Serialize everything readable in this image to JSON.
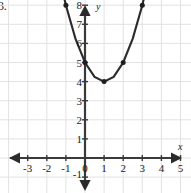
{
  "problem": {
    "number_label": "3."
  },
  "axes": {
    "x_name": "x",
    "y_name": "y",
    "x_tick_labels": [
      "-3",
      "-2",
      "-1",
      "0",
      "1",
      "2",
      "3",
      "4",
      "5"
    ],
    "x_tick_values": [
      -3,
      -2,
      -1,
      0,
      1,
      2,
      3,
      4,
      5
    ],
    "y_tick_labels": [
      "-1",
      "1",
      "2",
      "3",
      "4",
      "5",
      "6",
      "7",
      "8"
    ],
    "y_tick_values": [
      -1,
      1,
      2,
      3,
      4,
      5,
      6,
      7,
      8
    ],
    "origin_label": "0"
  },
  "colors": {
    "grid": "#e2e2e2",
    "axis": "#3a3a3a",
    "curve": "#2b2b2b",
    "point": "#1f1f1f",
    "text": "#1a1a1a",
    "background": "#ffffff"
  },
  "chart_data": {
    "type": "line",
    "title": "",
    "xlabel": "x",
    "ylabel": "y",
    "xlim": [
      -3.6,
      5.9
    ],
    "ylim": [
      -1.8,
      9.2
    ],
    "grid": true,
    "legend": "none",
    "series": [
      {
        "name": "parabola",
        "equation": "y = x^2 - 2x + 5",
        "vertex": [
          1,
          4
        ],
        "direction": "opens-up",
        "x": [
          -1.15,
          -1.0,
          -0.5,
          0.0,
          0.5,
          1.0,
          1.5,
          2.0,
          2.5,
          3.0,
          3.15
        ],
        "y": [
          8.64,
          8.0,
          6.25,
          5.0,
          4.25,
          4.0,
          4.25,
          5.0,
          6.25,
          8.0,
          8.64
        ],
        "marked_points": [
          {
            "x": -1,
            "y": 8
          },
          {
            "x": 0,
            "y": 5
          },
          {
            "x": 1,
            "y": 4
          },
          {
            "x": 2,
            "y": 5
          },
          {
            "x": 3,
            "y": 8
          }
        ],
        "arrow_ends": [
          "upper-left",
          "upper-right"
        ]
      }
    ]
  }
}
